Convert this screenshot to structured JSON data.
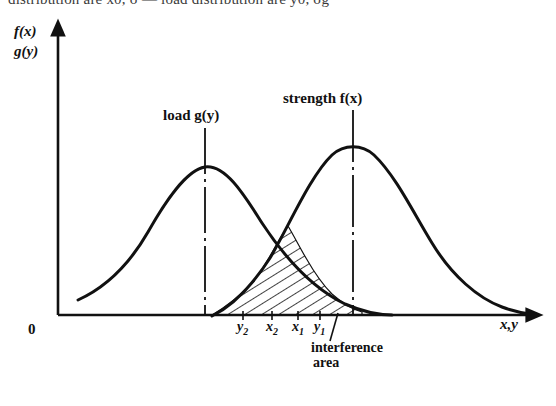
{
  "caption": {
    "text": "distribution are x0, σ — load distribution are y0, σg"
  },
  "figure": {
    "axis": {
      "y_label_line1": "f(x)",
      "y_label_line2": "g(y)",
      "x_label": "x,y",
      "origin_label": "0"
    },
    "annotations": {
      "load_label": "load  g(y)",
      "strength_label": "strength  f(x)",
      "interference_line1": "interference",
      "interference_line2": "area"
    },
    "ticks": [
      {
        "label": "y",
        "sub": "2",
        "x": 243
      },
      {
        "label": "x",
        "sub": "2",
        "x": 272
      },
      {
        "label": "x",
        "sub": "1",
        "x": 298
      },
      {
        "label": "y",
        "sub": "1",
        "x": 320
      }
    ],
    "colors": {
      "ink": "#111111",
      "background": "#ffffff"
    }
  },
  "chart_data": {
    "type": "line",
    "xlabel": "x,y",
    "ylabel": "f(x) g(y)",
    "xlim": [
      58,
      540
    ],
    "ylim": [
      0,
      315
    ],
    "grid": false,
    "legend": "inline-annotations",
    "series": [
      {
        "name": "load g(y)",
        "distribution": "normal",
        "mean_px": 205,
        "peak_y_px": 167,
        "baseline_y_px": 315,
        "sigma_px": 62,
        "mean_line_style": "dash-dot",
        "points": [
          [
            78,
            300
          ],
          [
            92,
            293
          ],
          [
            106,
            283
          ],
          [
            120,
            270
          ],
          [
            134,
            253
          ],
          [
            148,
            232
          ],
          [
            162,
            209
          ],
          [
            176,
            189
          ],
          [
            190,
            173
          ],
          [
            205,
            167
          ],
          [
            220,
            170
          ],
          [
            234,
            182
          ],
          [
            248,
            201
          ],
          [
            262,
            223
          ],
          [
            276,
            244
          ],
          [
            290,
            263
          ],
          [
            304,
            278
          ],
          [
            318,
            290
          ],
          [
            332,
            299
          ],
          [
            346,
            305
          ],
          [
            360,
            310
          ],
          [
            374,
            313
          ],
          [
            388,
            315
          ]
        ]
      },
      {
        "name": "strength f(x)",
        "distribution": "normal",
        "mean_px": 353,
        "peak_y_px": 145,
        "baseline_y_px": 315,
        "sigma_px": 70,
        "mean_line_style": "dash-dot",
        "points": [
          [
            212,
            315
          ],
          [
            226,
            307
          ],
          [
            240,
            296
          ],
          [
            254,
            281
          ],
          [
            268,
            260
          ],
          [
            282,
            234
          ],
          [
            296,
            206
          ],
          [
            310,
            180
          ],
          [
            324,
            160
          ],
          [
            338,
            148
          ],
          [
            353,
            145
          ],
          [
            368,
            148
          ],
          [
            382,
            157
          ],
          [
            396,
            174
          ],
          [
            410,
            196
          ],
          [
            424,
            221
          ],
          [
            438,
            246
          ],
          [
            452,
            268
          ],
          [
            466,
            285
          ],
          [
            480,
            297
          ],
          [
            494,
            304
          ],
          [
            508,
            309
          ],
          [
            522,
            312
          ],
          [
            536,
            314
          ]
        ]
      }
    ],
    "shaded_region": {
      "name": "interference area",
      "hatch": "diagonal",
      "x_start_px": 212,
      "x_end_px": 358,
      "description": "Region bounded below by the x-axis and above by the lower envelope (minimum) of the load and strength density curves; represents the probability that load exceeds strength."
    },
    "markers": {
      "y2": 243,
      "x2": 272,
      "x1": 298,
      "y1": 320
    }
  }
}
